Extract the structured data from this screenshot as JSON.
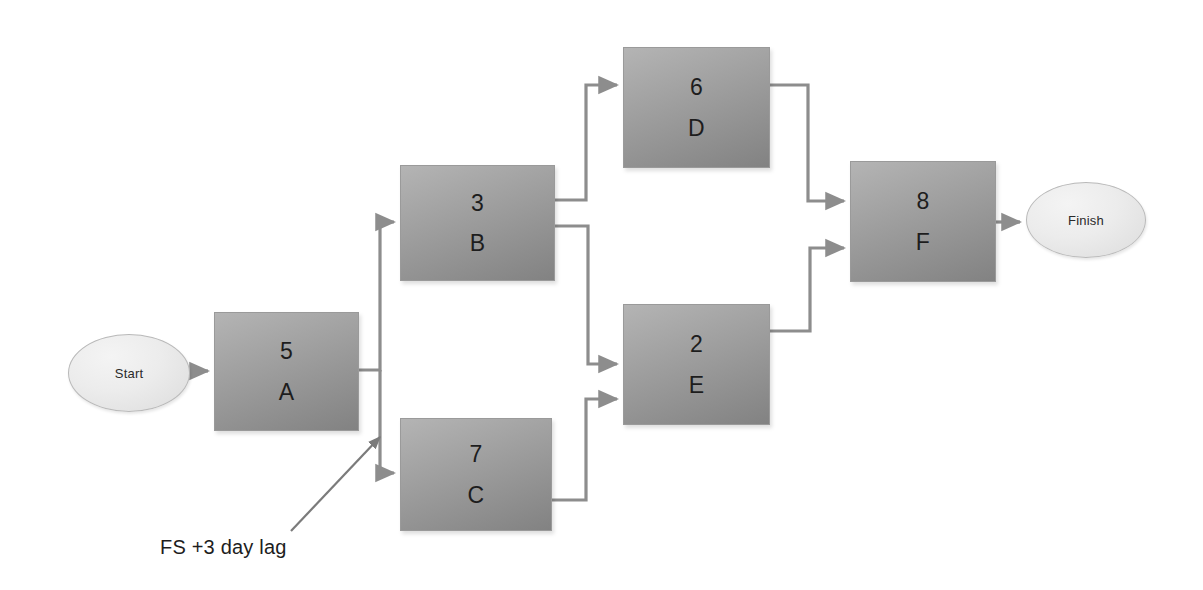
{
  "diagram": {
    "type": "precedence-network",
    "background_color": "#ffffff",
    "node_fill_top": "#b4b4b4",
    "node_fill_bottom": "#828282",
    "connector_color": "#8d8d8d",
    "text_color": "#1d1d1d"
  },
  "terminators": {
    "start": {
      "label": "Start",
      "x": 68,
      "y": 334,
      "width": 122,
      "height": 78
    },
    "finish": {
      "label": "Finish",
      "x": 1026,
      "y": 182,
      "width": 120,
      "height": 76
    }
  },
  "nodes": [
    {
      "id": "A",
      "duration": "5",
      "x": 214,
      "y": 312,
      "width": 145,
      "height": 119
    },
    {
      "id": "B",
      "duration": "3",
      "x": 400,
      "y": 165,
      "width": 155,
      "height": 116
    },
    {
      "id": "C",
      "duration": "7",
      "x": 400,
      "y": 418,
      "width": 152,
      "height": 113
    },
    {
      "id": "D",
      "duration": "6",
      "x": 623,
      "y": 47,
      "width": 147,
      "height": 121
    },
    {
      "id": "E",
      "duration": "2",
      "x": 623,
      "y": 304,
      "width": 147,
      "height": 121
    },
    {
      "id": "F",
      "duration": "8",
      "x": 850,
      "y": 161,
      "width": 146,
      "height": 121
    }
  ],
  "edges": [
    {
      "from": "Start",
      "to": "A",
      "path": "M 190 371 L 208 371",
      "relationship": "FS"
    },
    {
      "from": "A",
      "to": "B",
      "path": "M 359 370 L 380 370 L 380 222 L 394 222",
      "relationship": "FS"
    },
    {
      "from": "A",
      "to": "C",
      "path": "M 380 370 L 380 473 L 394 473",
      "relationship": "FS +3 day lag"
    },
    {
      "from": "B",
      "to": "D",
      "path": "M 555 200 L 586 200 L 586 85 L 617 85",
      "relationship": "FS"
    },
    {
      "from": "B",
      "to": "E",
      "path": "M 555 226 L 588 226 L 588 364 L 617 364",
      "relationship": "FS"
    },
    {
      "from": "C",
      "to": "E",
      "path": "M 552 500 L 586 500 L 586 399 L 617 399",
      "relationship": "FS"
    },
    {
      "from": "D",
      "to": "F",
      "path": "M 770 85 L 808 85 L 808 201 L 844 201",
      "relationship": "FS"
    },
    {
      "from": "E",
      "to": "F",
      "path": "M 770 331 L 810 331 L 810 248 L 844 248",
      "relationship": "FS"
    },
    {
      "from": "F",
      "to": "Finish",
      "path": "M 996 222 L 1020 222",
      "relationship": "FS"
    }
  ],
  "annotation": {
    "text": "FS +3 day lag",
    "label_x": 160,
    "label_y": 536,
    "leader_path": "M 291 531 L 380 437"
  }
}
